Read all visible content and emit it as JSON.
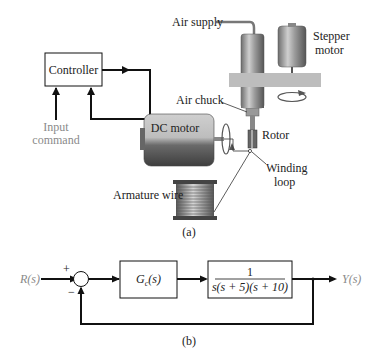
{
  "figure_a": {
    "caption": "(a)",
    "labels": {
      "controller": "Controller",
      "input_command_line1": "Input",
      "input_command_line2": "command",
      "dc_motor": "DC motor",
      "air_supply": "Air supply",
      "stepper_motor_line1": "Stepper",
      "stepper_motor_line2": "motor",
      "air_chuck": "Air chuck",
      "rotor": "Rotor",
      "winding_loop_line1": "Winding",
      "winding_loop_line2": "loop",
      "armature_wire": "Armature wire"
    }
  },
  "figure_b": {
    "caption": "(b)",
    "input": "R(s)",
    "output": "Y(s)",
    "sum_plus": "+",
    "sum_minus": "−",
    "controller_block": "Gc(s)",
    "controller_block_main": "G",
    "controller_block_sub": "c",
    "controller_block_arg": "(s)",
    "plant_numerator": "1",
    "plant_denominator": "s(s + 5)(s + 10)"
  },
  "colors": {
    "line": "#111111",
    "gray_text": "#8a8a8a",
    "plate": "#bdbdbd"
  }
}
